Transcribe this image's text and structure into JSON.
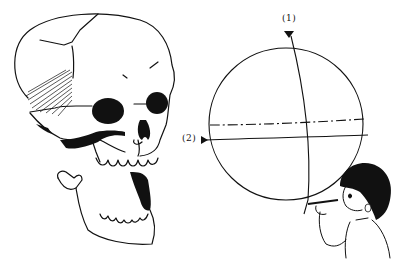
{
  "illustration": {
    "labels": {
      "marker_1": "(1)",
      "marker_2": "(2)"
    },
    "elements": {
      "skull": "skull-with-open-jaw",
      "sphere": "cranium-sphere-construction",
      "child": "child-measuring-with-pencil"
    },
    "colors": {
      "ink": "#111111",
      "paper": "#ffffff"
    }
  }
}
